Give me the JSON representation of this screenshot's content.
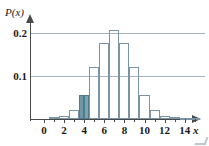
{
  "chart_data": {
    "type": "bar",
    "title": "",
    "subtitle": "",
    "xlabel": "x",
    "ylabel": "P(x)",
    "xlim": [
      -0.6,
      15.0
    ],
    "ylim": [
      0,
      0.225
    ],
    "grid": "horizontal",
    "legend": "none",
    "x_ticks": [
      {
        "value": 0,
        "label": "0"
      },
      {
        "value": 2,
        "label": "2"
      },
      {
        "value": 4,
        "label": "4"
      },
      {
        "value": 6,
        "label": "6"
      },
      {
        "value": 8,
        "label": "8"
      },
      {
        "value": 10,
        "label": "10"
      },
      {
        "value": 12,
        "label": "12"
      },
      {
        "value": 14,
        "label": "14"
      }
    ],
    "x_minor_ticks": [
      1,
      3,
      5,
      7,
      9,
      11,
      13,
      15
    ],
    "y_ticks": [
      {
        "value": 0.1,
        "label": "0.1"
      },
      {
        "value": 0.2,
        "label": "0.2"
      }
    ],
    "categories": [
      0,
      1,
      2,
      3,
      4,
      5,
      6,
      7,
      8,
      9,
      10,
      11,
      12,
      13,
      14,
      15
    ],
    "values": [
      0.0,
      0.004,
      0.008,
      0.022,
      0.056,
      0.121,
      0.177,
      0.206,
      0.177,
      0.121,
      0.056,
      0.022,
      0.008,
      0.004,
      0.002,
      0.001
    ],
    "highlighted_bars": [
      4
    ],
    "highlight_color": "#6f97a6",
    "bar_outline_color": "#7a94a4",
    "gridline_color": "#a9b3bb",
    "axis_color": "#4a4a4a",
    "background_color": "#ffffff",
    "annotations": []
  },
  "axes": {
    "y_title": "P(x)",
    "x_title": "x"
  }
}
